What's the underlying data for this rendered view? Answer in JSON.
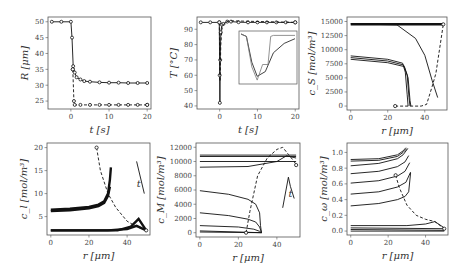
{
  "figure": {
    "background": "#ffffff",
    "line_color": "#111111",
    "axis_color": "#555555"
  },
  "chart_data": [
    {
      "id": "R_vs_t",
      "type": "line",
      "box": [
        48,
        17,
        151,
        109
      ],
      "xlabel": "t [s]",
      "ylabel": "R [μm]",
      "xlim": [
        -6,
        21
      ],
      "ylim": [
        22.5,
        51.5
      ],
      "xticks": [
        0,
        10,
        20
      ],
      "yticks": [
        25,
        30,
        35,
        40,
        45,
        50
      ],
      "series": [
        {
          "name": "solid",
          "dash": false,
          "markers": true,
          "x": [
            -5,
            -2.5,
            0,
            0.3,
            0.6,
            1,
            1.5,
            2.5,
            3.5,
            5,
            7.5,
            10,
            12.5,
            15,
            17.5,
            20
          ],
          "y": [
            50,
            50,
            50,
            45,
            36,
            34,
            32.5,
            31.8,
            31.3,
            31.1,
            30.9,
            30.8,
            30.8,
            30.7,
            30.7,
            30.7
          ]
        },
        {
          "name": "dashed",
          "dash": true,
          "markers": true,
          "x": [
            0.5,
            0.8,
            1,
            2.5,
            5,
            7.5,
            10,
            12.5,
            15,
            17.5,
            20
          ],
          "y": [
            35,
            25,
            23.8,
            23.8,
            23.8,
            23.8,
            23.8,
            23.8,
            23.8,
            23.8,
            23.8
          ]
        }
      ]
    },
    {
      "id": "T_vs_t",
      "type": "line",
      "box": [
        197,
        17,
        299,
        109
      ],
      "xlabel": "t [s]",
      "ylabel": "T [°C]",
      "xlim": [
        -6,
        21
      ],
      "ylim": [
        38,
        98
      ],
      "xticks": [
        0,
        10,
        20
      ],
      "yticks": [
        40,
        50,
        60,
        70,
        80,
        90
      ],
      "series": [
        {
          "name": "solid",
          "dash": false,
          "markers": true,
          "x": [
            -5,
            -2.5,
            -0.1,
            0,
            0.05,
            0.15,
            0.3,
            0.6,
            1,
            2,
            3,
            5,
            7.5,
            10,
            12.5,
            15,
            17.5,
            20
          ],
          "y": [
            94.5,
            94.5,
            94.5,
            60,
            42,
            70,
            88,
            93,
            93.5,
            95,
            95,
            94.6,
            94.5,
            94.5,
            94.5,
            94.5,
            94.5,
            94.5
          ]
        },
        {
          "name": "dashed",
          "dash": true,
          "markers": false,
          "x": [
            -0.1,
            0.1,
            0.3,
            0.6,
            1,
            1.5,
            2.5,
            20
          ],
          "y": [
            94.5,
            56,
            80,
            90,
            93,
            94.5,
            95.5,
            94.5
          ]
        }
      ],
      "inset": {
        "box": [
          239,
          31,
          297,
          84
        ],
        "note": "zoomed view of temperature dip near t=0",
        "series": [
          {
            "x": [
              0,
              0.1,
              0.2,
              0.3,
              0.45,
              0.6,
              0.8,
              1.0
            ],
            "y": [
              1,
              0.95,
              0.4,
              0.1,
              0.2,
              0.6,
              0.8,
              0.9
            ]
          },
          {
            "x": [
              0,
              0.1,
              0.2,
              0.3,
              0.4,
              0.5,
              0.55,
              0.6,
              1.0
            ],
            "y": [
              1,
              0.95,
              0.3,
              0.02,
              0.35,
              0.35,
              0.95,
              0.97,
              0.97
            ]
          }
        ]
      }
    },
    {
      "id": "cS_vs_r",
      "type": "line",
      "box": [
        347,
        17,
        447,
        110
      ],
      "xlabel": "r [μm]",
      "ylabel": "c_S [mol/m³]",
      "xlim": [
        -2,
        52
      ],
      "ylim": [
        -700,
        15800
      ],
      "xticks": [
        0,
        20,
        40
      ],
      "yticks": [
        0,
        2500,
        5000,
        7500,
        10000,
        12500,
        15000
      ],
      "series": [
        {
          "name": "initial-band",
          "dash": false,
          "x": [
            0,
            50
          ],
          "y": [
            14500,
            14500
          ]
        },
        {
          "name": "early",
          "dash": false,
          "x": [
            0,
            25,
            35,
            40,
            44,
            47
          ],
          "y": [
            14600,
            14400,
            12000,
            9000,
            4500,
            1500
          ]
        },
        {
          "name": "late-1",
          "dash": false,
          "x": [
            0,
            20,
            28,
            29.5,
            30.5,
            31
          ],
          "y": [
            8900,
            8300,
            7600,
            6000,
            2000,
            0
          ]
        },
        {
          "name": "late-2",
          "dash": false,
          "x": [
            0,
            20,
            28.5,
            30.5,
            31.5,
            32
          ],
          "y": [
            8600,
            8000,
            7300,
            5500,
            1500,
            0
          ]
        },
        {
          "name": "late-3",
          "dash": false,
          "x": [
            0,
            20,
            29,
            31,
            32,
            32.5
          ],
          "y": [
            8300,
            7700,
            7000,
            5000,
            1000,
            0
          ]
        },
        {
          "name": "front",
          "dash": true,
          "x": [
            24,
            32,
            38,
            41,
            44,
            46,
            50
          ],
          "y": [
            0,
            0,
            0,
            300,
            3500,
            5800,
            14500
          ]
        }
      ]
    },
    {
      "id": "cl_vs_r",
      "type": "line",
      "box": [
        47,
        143,
        150,
        235
      ],
      "xlabel": "r [μm]",
      "ylabel": "c_l [mol/m³]",
      "xlim": [
        -2,
        52
      ],
      "ylim": [
        1,
        21
      ],
      "xticks": [
        0,
        20,
        40
      ],
      "yticks": [
        5,
        10,
        15,
        20
      ],
      "annotation": {
        "text": "t",
        "x": 45,
        "y": 11.5
      },
      "series": [
        {
          "name": "band-high",
          "dash": false,
          "x": [
            0,
            10,
            20,
            25,
            28,
            30,
            31,
            31.5
          ],
          "y": [
            6.5,
            6.7,
            7.1,
            7.6,
            8.3,
            10,
            13,
            15.7
          ]
        },
        {
          "name": "band-high-2",
          "dash": false,
          "x": [
            0,
            10,
            20,
            25,
            28,
            30,
            31
          ],
          "y": [
            6.2,
            6.4,
            6.8,
            7.3,
            8,
            9.5,
            11.5
          ]
        },
        {
          "name": "band-low",
          "dash": false,
          "x": [
            0,
            30,
            40,
            45,
            50
          ],
          "y": [
            2,
            2,
            2.3,
            3,
            2
          ]
        },
        {
          "name": "band-low-2",
          "dash": false,
          "x": [
            0,
            35,
            42,
            46,
            50
          ],
          "y": [
            2,
            2,
            2.8,
            4.5,
            2
          ]
        },
        {
          "name": "arrow",
          "dash": false,
          "x": [
            45,
            49
          ],
          "y": [
            17,
            10
          ]
        },
        {
          "name": "front",
          "dash": true,
          "x": [
            24,
            26,
            30,
            34,
            40,
            45,
            50
          ],
          "y": [
            20,
            15,
            10,
            7,
            4,
            2.8,
            2
          ]
        }
      ]
    },
    {
      "id": "cM_vs_r",
      "type": "line",
      "box": [
        196,
        143,
        300,
        237
      ],
      "xlabel": "r [μm]",
      "ylabel": "c_M [mol/m³]",
      "xlim": [
        -2,
        52
      ],
      "ylim": [
        -600,
        12600
      ],
      "xticks": [
        0,
        20,
        40
      ],
      "yticks": [
        0,
        2000,
        4000,
        6000,
        8000,
        10000,
        12000
      ],
      "annotation": {
        "text": "t",
        "x": 46,
        "y": 5000
      },
      "series": [
        {
          "name": "s1",
          "dash": false,
          "x": [
            0,
            50
          ],
          "y": [
            10900,
            10900
          ]
        },
        {
          "name": "s2",
          "dash": false,
          "x": [
            0,
            50
          ],
          "y": [
            10700,
            10700
          ]
        },
        {
          "name": "s3",
          "dash": false,
          "x": [
            0,
            40,
            50
          ],
          "y": [
            10000,
            10000,
            10000
          ]
        },
        {
          "name": "s4",
          "dash": false,
          "x": [
            0,
            25,
            40,
            45,
            50
          ],
          "y": [
            9200,
            9300,
            10000,
            10800,
            10500
          ]
        },
        {
          "name": "s5",
          "dash": false,
          "x": [
            0,
            15,
            25,
            29,
            31,
            31.5,
            32
          ],
          "y": [
            5900,
            5400,
            4700,
            4000,
            2800,
            1000,
            0
          ]
        },
        {
          "name": "s6",
          "dash": false,
          "x": [
            0,
            15,
            25,
            29,
            31,
            32
          ],
          "y": [
            2800,
            2400,
            1900,
            1500,
            800,
            0
          ]
        },
        {
          "name": "s7",
          "dash": false,
          "x": [
            0,
            20,
            28,
            31,
            32
          ],
          "y": [
            1000,
            800,
            500,
            200,
            0
          ]
        },
        {
          "name": "s8",
          "dash": false,
          "x": [
            0,
            32
          ],
          "y": [
            250,
            0
          ]
        },
        {
          "name": "s9",
          "dash": false,
          "x": [
            0,
            32
          ],
          "y": [
            100,
            0
          ]
        },
        {
          "name": "arrow",
          "dash": false,
          "x": [
            43,
            46,
            47,
            49
          ],
          "y": [
            3500,
            7800,
            6500,
            4800
          ]
        },
        {
          "name": "front",
          "dash": true,
          "x": [
            24,
            26,
            30,
            35,
            40,
            43,
            46,
            49,
            50
          ],
          "y": [
            0,
            3000,
            8000,
            10500,
            11700,
            12000,
            11000,
            10000,
            9500
          ]
        }
      ]
    },
    {
      "id": "cw_vs_r",
      "type": "line",
      "box": [
        347,
        143,
        448,
        235
      ],
      "xlabel": "r [μm]",
      "ylabel": "c_ω [mol/m³]",
      "xlim": [
        -2,
        52
      ],
      "ylim": [
        -0.05,
        1.12
      ],
      "xticks": [
        0,
        20,
        40
      ],
      "yticks": [
        0.0,
        0.2,
        0.4,
        0.6,
        0.8,
        1.0
      ],
      "series": [
        {
          "name": "s1",
          "dash": false,
          "x": [
            0,
            15,
            25,
            28,
            29.5
          ],
          "y": [
            0.91,
            0.92,
            0.97,
            1.02,
            1.06
          ]
        },
        {
          "name": "s2",
          "dash": false,
          "x": [
            0,
            15,
            25,
            28,
            30
          ],
          "y": [
            0.89,
            0.9,
            0.95,
            1.0,
            1.05
          ]
        },
        {
          "name": "s3",
          "dash": false,
          "x": [
            0,
            15,
            25,
            28,
            30.5
          ],
          "y": [
            0.83,
            0.86,
            0.92,
            0.97,
            1.05
          ]
        },
        {
          "name": "s4",
          "dash": false,
          "x": [
            0,
            15,
            25,
            29,
            31
          ],
          "y": [
            0.73,
            0.76,
            0.82,
            0.88,
            0.96
          ]
        },
        {
          "name": "s5",
          "dash": false,
          "x": [
            0,
            15,
            25,
            29,
            31.5
          ],
          "y": [
            0.61,
            0.64,
            0.7,
            0.76,
            0.87
          ]
        },
        {
          "name": "s6",
          "dash": false,
          "x": [
            0,
            15,
            25,
            29.5,
            32
          ],
          "y": [
            0.47,
            0.5,
            0.56,
            0.62,
            0.75
          ]
        },
        {
          "name": "s7",
          "dash": false,
          "x": [
            0,
            15,
            25,
            29,
            31,
            32
          ],
          "y": [
            0.32,
            0.35,
            0.4,
            0.44,
            0.5,
            0.74
          ]
        },
        {
          "name": "s8",
          "dash": false,
          "x": [
            0,
            30,
            40,
            45,
            50
          ],
          "y": [
            0.07,
            0.07,
            0.09,
            0.12,
            0.04
          ]
        },
        {
          "name": "s9",
          "dash": false,
          "x": [
            0,
            50
          ],
          "y": [
            0.04,
            0.03
          ]
        },
        {
          "name": "s10",
          "dash": false,
          "x": [
            0,
            50
          ],
          "y": [
            0.02,
            0.01
          ]
        },
        {
          "name": "s11",
          "dash": false,
          "x": [
            0,
            50
          ],
          "y": [
            0.0,
            0.0
          ]
        },
        {
          "name": "front",
          "dash": true,
          "x": [
            24,
            26,
            30,
            35,
            40,
            45,
            50
          ],
          "y": [
            0.71,
            0.55,
            0.33,
            0.2,
            0.15,
            0.12,
            0.03
          ]
        }
      ]
    }
  ]
}
